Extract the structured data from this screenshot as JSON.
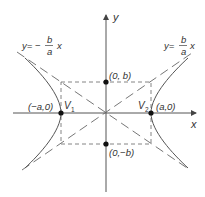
{
  "diagram": {
    "type": "hyperbola",
    "equation_form": "x^2/a^2 - y^2/b^2 = 1",
    "axes": {
      "x_label": "x",
      "y_label": "y"
    },
    "asymptotes": {
      "left": {
        "prefix": "y= −",
        "num": "b",
        "den": "a",
        "suffix": "x"
      },
      "right": {
        "prefix": "y=",
        "num": "b",
        "den": "a",
        "suffix": "x"
      }
    },
    "points": {
      "v1": {
        "name": "V",
        "sub": "1",
        "coord": "(−a,0)"
      },
      "v2": {
        "name": "V",
        "sub": "2",
        "coord": "(a,0)"
      },
      "top": {
        "coord": "(0, b)"
      },
      "bottom": {
        "coord": "(0,−b)"
      }
    },
    "colors": {
      "stroke": "#555555",
      "dash": "#666666",
      "dot": "#111111",
      "text": "#333333"
    }
  }
}
